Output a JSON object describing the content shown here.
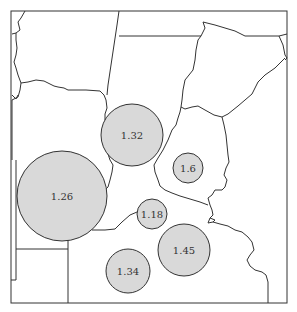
{
  "map": {
    "type": "proportional-symbol",
    "colors": {
      "background": "#ffffff",
      "bubble_fill": "#d9d9d9",
      "stroke": "#333333"
    },
    "bubbles": [
      {
        "label": "1.32",
        "cx": 132,
        "cy": 135,
        "r": 31
      },
      {
        "label": "1.26",
        "cx": 62,
        "cy": 196,
        "r": 45
      },
      {
        "label": "1.6",
        "cx": 188,
        "cy": 168,
        "r": 15
      },
      {
        "label": "1.18",
        "cx": 152,
        "cy": 214,
        "r": 15
      },
      {
        "label": "1.45",
        "cx": 184,
        "cy": 250,
        "r": 26
      },
      {
        "label": "1.34",
        "cx": 128,
        "cy": 271,
        "r": 22
      }
    ]
  }
}
